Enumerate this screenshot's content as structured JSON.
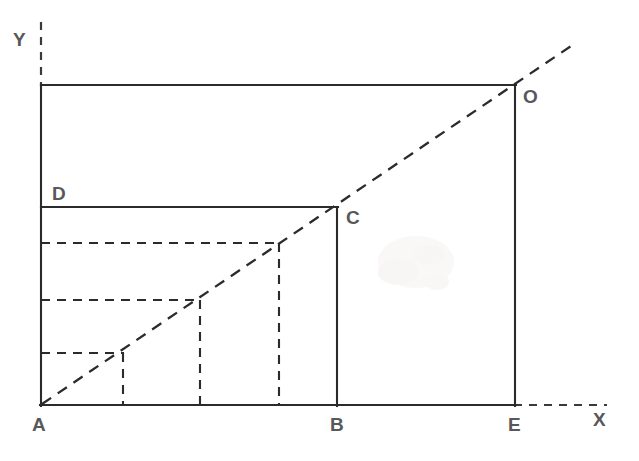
{
  "figure": {
    "type": "geometry-diagram",
    "canvas": {
      "width": 639,
      "height": 461
    },
    "background_color": "#ffffff",
    "stroke_color": "#2b2b2b",
    "label_color": "#58585a"
  },
  "axes": {
    "x_axis": {
      "label": "X",
      "label_x": 600,
      "label_y": 419,
      "style": "dashed",
      "from": {
        "x": 515,
        "y": 405
      },
      "to": {
        "x": 607,
        "y": 405
      }
    },
    "y_axis": {
      "label": "Y",
      "label_x": 20,
      "label_y": 46,
      "style": "dashed",
      "from": {
        "x": 41,
        "y": 22
      },
      "to": {
        "x": 41,
        "y": 85
      }
    }
  },
  "points": [
    {
      "name": "A",
      "x": 41,
      "y": 405,
      "label_x": 32,
      "label_y": 431,
      "role": "origin-corner"
    },
    {
      "name": "B",
      "x": 337,
      "y": 405,
      "label_x": 330,
      "label_y": 431,
      "role": "base-corner"
    },
    {
      "name": "C",
      "x": 337,
      "y": 207,
      "label_x": 346,
      "label_y": 224,
      "role": "inner-rect-corner"
    },
    {
      "name": "D",
      "x": 41,
      "y": 207,
      "label_x": 52,
      "label_y": 200,
      "role": "inner-rect-corner"
    },
    {
      "name": "E",
      "x": 515,
      "y": 405,
      "label_x": 508,
      "label_y": 431,
      "role": "base-corner"
    },
    {
      "name": "O",
      "x": 515,
      "y": 85,
      "label_x": 523,
      "label_y": 103,
      "role": "outer-rect-corner"
    }
  ],
  "solid_rectangles": [
    {
      "name": "outer-rectangle-AEOF",
      "vertices": "A(41,405) E(515,405) O(515,85) F(41,85)",
      "x": 41,
      "y": 85,
      "width": 474,
      "height": 320,
      "style": "solid"
    },
    {
      "name": "inner-rectangle-ABCD",
      "vertices": "A(41,405) B(337,405) C(337,207) D(41,207)",
      "x": 41,
      "y": 207,
      "width": 296,
      "height": 198,
      "style": "solid"
    }
  ],
  "dashed_rectangles": [
    {
      "name": "dashed-rectangle-3",
      "corner": {
        "x": 279,
        "y": 243
      },
      "x": 41,
      "y": 243,
      "width": 238,
      "height": 162,
      "style": "dashed"
    },
    {
      "name": "dashed-rectangle-2",
      "corner": {
        "x": 200,
        "y": 300
      },
      "x": 41,
      "y": 300,
      "width": 159,
      "height": 105,
      "style": "dashed"
    },
    {
      "name": "dashed-rectangle-1",
      "corner": {
        "x": 123,
        "y": 353
      },
      "x": 41,
      "y": 353,
      "width": 82,
      "height": 52,
      "style": "dashed"
    }
  ],
  "diagonal": {
    "name": "common-diagonal-ray",
    "description": "Dashed ray from A through all rectangle corners, extended past O",
    "from": {
      "x": 41,
      "y": 405
    },
    "through": [
      {
        "x": 123,
        "y": 353
      },
      {
        "x": 200,
        "y": 300
      },
      {
        "x": 279,
        "y": 243
      },
      {
        "x": 337,
        "y": 207
      },
      {
        "x": 515,
        "y": 85
      }
    ],
    "to": {
      "x": 574,
      "y": 44
    },
    "style": "dashed"
  }
}
